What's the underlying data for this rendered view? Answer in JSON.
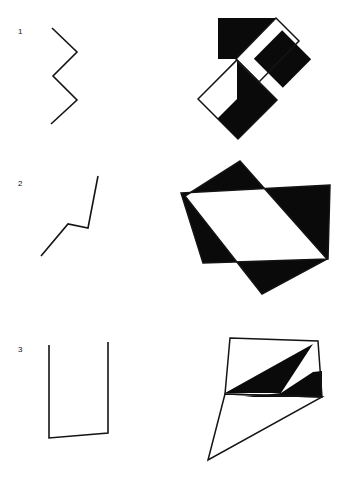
{
  "page": {
    "background_color": "#ffffff",
    "ink_color": "#141414",
    "width": 351,
    "height": 484
  },
  "rows": [
    {
      "id": "row-1",
      "label": "1"
    },
    {
      "id": "row-2",
      "label": "2"
    },
    {
      "id": "row-3",
      "label": "3"
    }
  ],
  "figures": {
    "row1_line": {
      "name": "zigzag-polyline",
      "description": "Four-segment zigzag opening to the left",
      "points": "52,28 77,52 53,76 77,100 51,124"
    },
    "row1_pattern": {
      "name": "rotated-square-composite",
      "description": "Tilted squares with black and white alternating quadrants forming an F-like mark",
      "black_shapes": [
        "218,18 276,18 236,59 218,59",
        "236,59 276,18 299,41 259,82",
        "236,60 277,100 238,139 198,99",
        "263,43 303,58 303,78 263,78",
        "262,39 303,39 303,79 262,79"
      ],
      "white_shapes": [
        "236,59 276,18 299,41 259,82",
        "198,99 237,60 237,99 198,138"
      ],
      "outlines": [
        "218,18 276,18 299,41 259,82 236,59 198,99 238,139 277,100 259,82",
        "262,39 303,39 303,79 262,79"
      ]
    },
    "row2_line": {
      "name": "bent-polyline",
      "description": "Three-segment rising line with a shallow notch",
      "points": "41,256 68,224 88,228 98,176"
    },
    "row2_pattern": {
      "name": "overlapping-quadrilaterals",
      "description": "Two overlapping tilted quadrilaterals with alternating black/white intersection regions, forming a star-like band",
      "quad_a": "181,193 330,185 328,259 203,263",
      "quad_b": "240,161 327,259 262,294 185,196",
      "outlines": [
        "181,193 330,185 328,259 203,263 181,193",
        "240,161 327,259 262,294 186,196 240,161"
      ]
    },
    "row3_line": {
      "name": "n-shaped-polyline",
      "description": "Letter N formed by vertical, diagonal and vertical strokes",
      "points": "49,345 49,438 108,433 108,342"
    },
    "row3_pattern": {
      "name": "quadrilateral-with-spike",
      "description": "Tilted quadrilateral with black wedge plus a long thin triangular spike extending to lower left",
      "quad": "230,338 318,341 322,397 225,394",
      "spike": "225,394 208,460 322,397",
      "black_wedges": [
        "313,344 225,393 281,393",
        "281,393 313,372 322,371 322,397 244,397"
      ],
      "outlines": [
        "230,338 318,341 322,397 225,394 230,338",
        "225,394 208,460 322,397"
      ]
    }
  }
}
